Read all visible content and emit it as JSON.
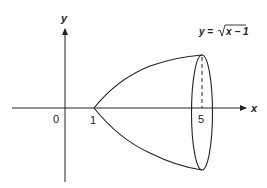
{
  "diagram": {
    "type": "solid-of-revolution",
    "axes": {
      "x_label": "x",
      "y_label": "y",
      "origin_label": "0"
    },
    "ticks": [
      {
        "label": "1",
        "x_value": 1
      },
      {
        "label": "5",
        "x_value": 5
      }
    ],
    "curve": {
      "equation_label_lhs": "y =",
      "equation_label_radicand": "x − 1",
      "function": "sqrt(x-1)",
      "domain": [
        1,
        5
      ]
    },
    "colors": {
      "stroke": "#222222",
      "background": "#ffffff"
    }
  }
}
